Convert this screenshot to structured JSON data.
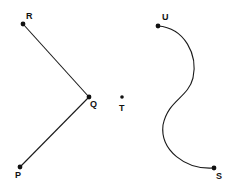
{
  "diagram": {
    "points": [
      {
        "id": "R",
        "label": "R",
        "x": 23,
        "y": 24
      },
      {
        "id": "Q",
        "label": "Q",
        "x": 89,
        "y": 97
      },
      {
        "id": "P",
        "label": "P",
        "x": 20,
        "y": 167
      },
      {
        "id": "T",
        "label": "T",
        "x": 122,
        "y": 97
      },
      {
        "id": "U",
        "label": "U",
        "x": 158,
        "y": 26
      },
      {
        "id": "S",
        "label": "S",
        "x": 214,
        "y": 168
      }
    ],
    "segments": [
      {
        "from": "R",
        "to": "Q"
      },
      {
        "from": "Q",
        "to": "P"
      }
    ],
    "curve": {
      "from": "U",
      "to": "S",
      "shape": "S-curve"
    },
    "colors": {
      "stroke": "#1a1a1a",
      "background": "#ffffff"
    }
  }
}
